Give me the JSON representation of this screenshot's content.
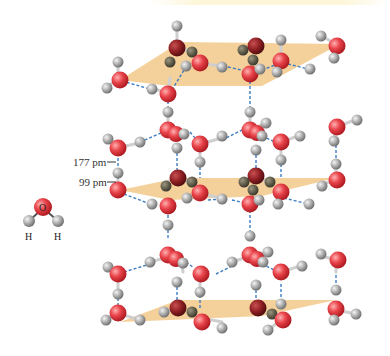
{
  "figure": {
    "labels": {
      "hbond_length": "177 pm",
      "covalent_length": "99 pm"
    },
    "water_molecule": {
      "oxygen_label": "O",
      "hydrogen_left_label": "H",
      "hydrogen_right_label": "H"
    },
    "layers": [
      "top",
      "middle",
      "bottom"
    ]
  },
  "colors": {
    "oxygen": "#e0343b",
    "oxygen_highlight": "#ff9a9a",
    "oxygen_dark": "#8c1a1e",
    "hydrogen": "#a6a6a6",
    "hydrogen_highlight": "#eeeeee",
    "hydrogen_dark": "#5e5a48",
    "hbond": "#3b7dc4",
    "plane": "#f2c98a",
    "bond": "#bdbdbd"
  }
}
